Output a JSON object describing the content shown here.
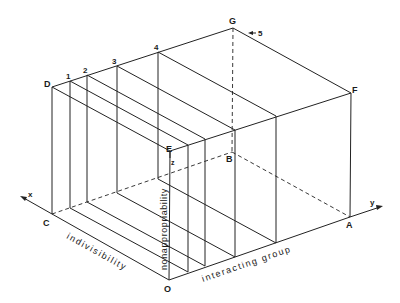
{
  "diagram": {
    "type": "isometric-box-with-slices",
    "vertices": {
      "D": {
        "label": "D",
        "x": 52,
        "y": 87
      },
      "G": {
        "label": "G",
        "x": 233,
        "y": 28
      },
      "F": {
        "label": "F",
        "x": 351,
        "y": 93
      },
      "E": {
        "label": "E",
        "x": 170,
        "y": 151
      },
      "C": {
        "label": "C",
        "x": 52,
        "y": 214
      },
      "O": {
        "label": "O",
        "x": 169,
        "y": 280
      },
      "A": {
        "label": "A",
        "x": 350,
        "y": 217
      },
      "B": {
        "label": "B",
        "x": 232,
        "y": 152
      }
    },
    "slice_labels": [
      "1",
      "2",
      "3",
      "4",
      "5"
    ],
    "axes": {
      "x": {
        "label": "x",
        "name": "indivisibility"
      },
      "y": {
        "label": "y",
        "name": "interacting group"
      },
      "z": {
        "label": "z",
        "name": "nonappropriability"
      }
    },
    "colors": {
      "line": "#222222",
      "background": "#ffffff"
    }
  }
}
